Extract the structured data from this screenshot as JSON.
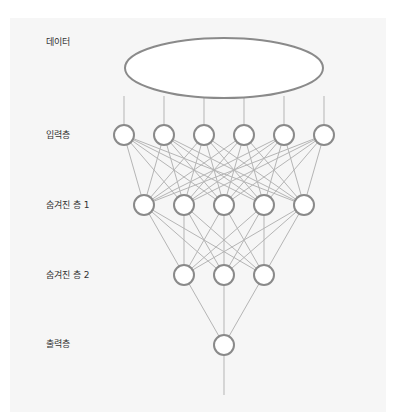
{
  "diagram": {
    "colors": {
      "background": "#ffffff",
      "panel": "#f6f6f6",
      "node_stroke": "#8a8a8a",
      "edge": "#b5b5b5",
      "label": "#333333"
    },
    "layers": [
      {
        "id": "data",
        "label": "데이터",
        "shape": "ellipse",
        "y": 68
      },
      {
        "id": "input",
        "label": "입력층",
        "nodes": 6,
        "y": 135
      },
      {
        "id": "hidden1",
        "label": "숨겨진 층 1",
        "nodes": 5,
        "y": 205
      },
      {
        "id": "hidden2",
        "label": "숨겨진 층 2",
        "nodes": 3,
        "y": 275
      },
      {
        "id": "output",
        "label": "출력층",
        "nodes": 1,
        "y": 345
      }
    ]
  }
}
